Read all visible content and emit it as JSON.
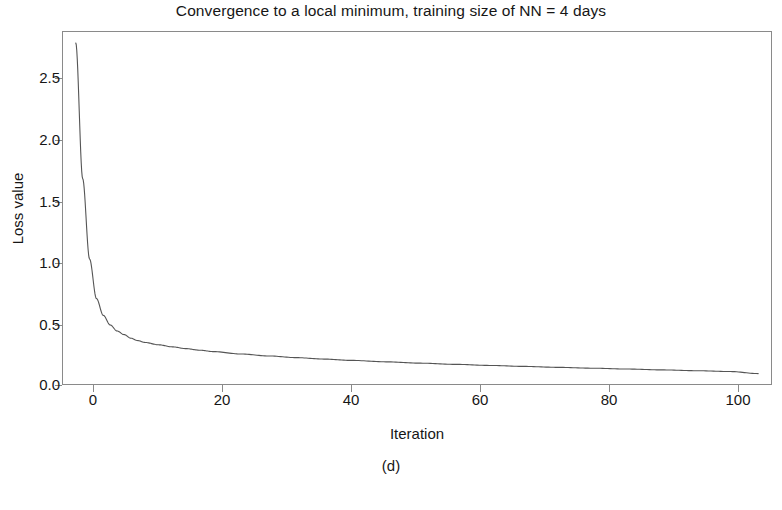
{
  "chart_data": {
    "type": "line",
    "title": "Convergence to a local minimum, training size of NN = 4 days",
    "xlabel": "Iteration",
    "ylabel": "Loss value",
    "caption": "(d)",
    "grid": false,
    "legend": null,
    "xlim": [
      -2,
      101
    ],
    "ylim": [
      0.0,
      2.95
    ],
    "xticks": [
      0,
      20,
      40,
      60,
      80,
      100
    ],
    "xtick_labels": [
      "0",
      "20",
      "40",
      "60",
      "80",
      "100"
    ],
    "yticks": [
      0.0,
      0.5,
      1.0,
      1.5,
      2.0,
      2.5
    ],
    "ytick_labels": [
      "0.0",
      "0.5",
      "1.0",
      "1.5",
      "2.0",
      "2.5"
    ],
    "line_color": "#555555",
    "line_width": 1.1,
    "series": [
      {
        "name": "Loss",
        "x": [
          0,
          1,
          2,
          3,
          4,
          5,
          6,
          7,
          8,
          9,
          10,
          12,
          14,
          16,
          18,
          20,
          24,
          28,
          32,
          36,
          40,
          45,
          50,
          55,
          60,
          65,
          70,
          75,
          80,
          85,
          90,
          95,
          99
        ],
        "y": [
          2.85,
          1.72,
          1.05,
          0.72,
          0.58,
          0.5,
          0.45,
          0.42,
          0.39,
          0.37,
          0.355,
          0.335,
          0.318,
          0.303,
          0.29,
          0.278,
          0.258,
          0.242,
          0.228,
          0.216,
          0.205,
          0.193,
          0.182,
          0.172,
          0.163,
          0.155,
          0.147,
          0.14,
          0.133,
          0.126,
          0.119,
          0.112,
          0.095
        ]
      }
    ]
  }
}
